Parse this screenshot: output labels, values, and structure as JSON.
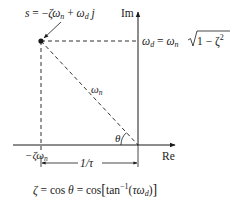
{
  "diagram": {
    "type": "s-plane pole geometry",
    "axes": {
      "imaginary_label": "Im",
      "real_label": "Re"
    },
    "pole_label": {
      "lhs": "s",
      "eq": " = −",
      "zeta": "ζ",
      "omega": "ω",
      "sub_n": "n",
      "plus": " + ",
      "sub_d": "d",
      "j": " j"
    },
    "omega_d_label": {
      "omega": "ω",
      "sub_d": "d",
      "eq": " = ",
      "sub_n": "n",
      "radicand": "1 − ζ",
      "sup": "2"
    },
    "radius_label": {
      "omega": "ω",
      "sub": "n"
    },
    "angle_label": "θ",
    "real_part_label": {
      "minus_zeta": "−ζ",
      "omega": "ω",
      "sub": "n"
    },
    "time_constant_label": "1/τ",
    "formula": {
      "zeta": "ζ",
      "part1": " = cos ",
      "theta": "θ",
      "part2": " = cos",
      "lbracket": "[",
      "tan": "tan",
      "sup": "−1",
      "lparen": "(",
      "tau": "τ",
      "omega": "ω",
      "sub_d": "d",
      "rparen": ")",
      "rbracket": "]"
    },
    "colors": {
      "ink": "#1a1a1a",
      "background": "#ffffff"
    }
  }
}
